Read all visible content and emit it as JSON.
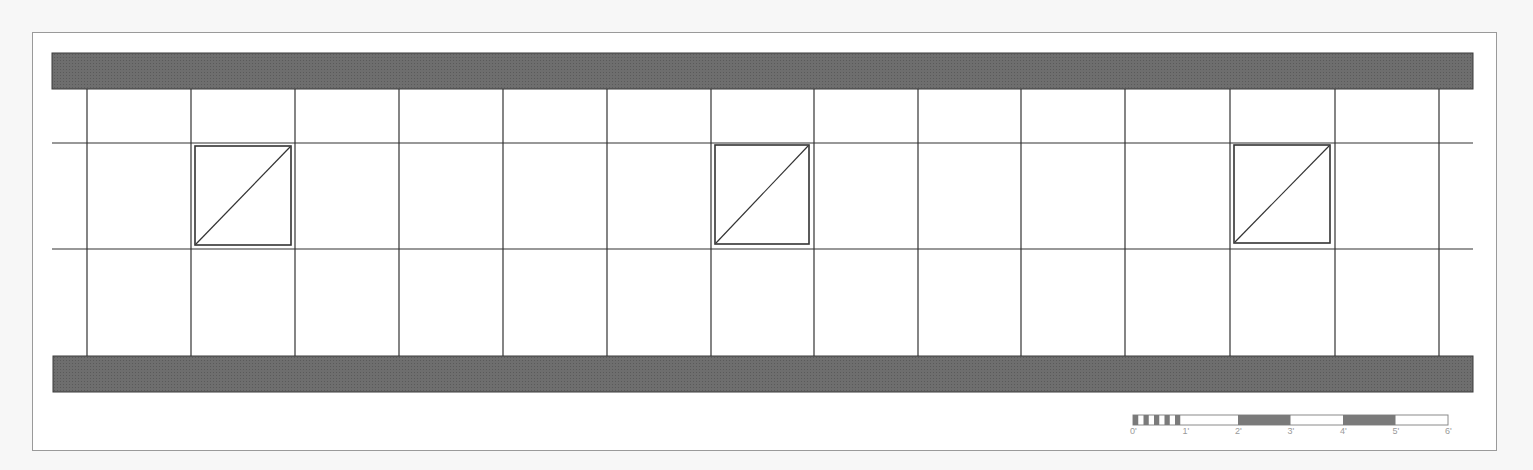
{
  "drawing": {
    "type": "ceiling grid plan",
    "colors": {
      "background": "#f7f7f7",
      "sheet": "#ffffff",
      "sheet_border": "#9a9a9a",
      "wall_fill": "#6e6e6e",
      "wall_stroke": "#3a3a3a",
      "grid_line": "#333333",
      "fixture_stroke": "#333333"
    },
    "walls": [
      {
        "name": "top-wall",
        "x": 52,
        "y": 53,
        "w": 1421,
        "h": 36
      },
      {
        "name": "bottom-wall",
        "x": 53,
        "y": 356,
        "w": 1420,
        "h": 36
      }
    ],
    "grid": {
      "vertical_x": [
        87,
        191,
        295,
        399,
        503,
        607,
        711,
        814,
        918,
        1021,
        1125,
        1230,
        1335,
        1439
      ],
      "vertical_y_range": [
        89,
        356
      ],
      "horizontal_y": [
        143,
        249
      ],
      "horizontal_x_range": [
        52,
        1473
      ]
    },
    "fixtures": [
      {
        "name": "fixture-1",
        "x": 195,
        "y": 146,
        "w": 96,
        "h": 99
      },
      {
        "name": "fixture-2",
        "x": 715,
        "y": 145,
        "w": 94,
        "h": 99
      },
      {
        "name": "fixture-3",
        "x": 1234,
        "y": 145,
        "w": 96,
        "h": 98
      }
    ]
  },
  "scale_bar": {
    "x": 1133,
    "y": 415,
    "unit_width": 52.5,
    "height": 10,
    "labels": [
      "0'",
      "1'",
      "2'",
      "3'",
      "4'",
      "5'",
      "6'"
    ]
  }
}
